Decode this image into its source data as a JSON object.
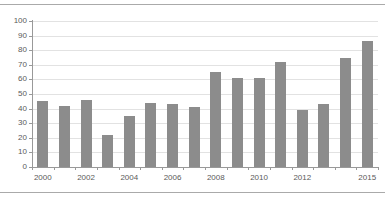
{
  "chart_data": {
    "type": "bar",
    "title": "",
    "subtitle": "",
    "xlabel": "",
    "ylabel": "",
    "categories": [
      "2000",
      "2001",
      "2002",
      "2003",
      "2004",
      "2005",
      "2006",
      "2007",
      "2008",
      "2009",
      "2010",
      "2011",
      "2012",
      "2013",
      "2014",
      "2015"
    ],
    "values": [
      45,
      42,
      46,
      22,
      35,
      44,
      43,
      41,
      65,
      61,
      61,
      72,
      39,
      43,
      75,
      86
    ],
    "series": [
      {
        "name": "",
        "values": [
          45,
          42,
          46,
          22,
          35,
          44,
          43,
          41,
          65,
          61,
          61,
          72,
          39,
          43,
          75,
          86
        ]
      }
    ],
    "ylim": [
      0,
      100
    ],
    "yticks": [
      0,
      10,
      20,
      30,
      40,
      50,
      60,
      70,
      80,
      90,
      100
    ],
    "ytick_labels": [
      "0",
      "10",
      "20",
      "30",
      "40",
      "50",
      "60",
      "70",
      "80",
      "90",
      "100"
    ],
    "xtick_labels": [
      "2000",
      "2002",
      "2004",
      "2006",
      "2008",
      "2010",
      "2012",
      "2015"
    ],
    "xtick_categories": [
      "2000",
      "2002",
      "2004",
      "2006",
      "2008",
      "2010",
      "2012",
      "2015"
    ],
    "grid": true,
    "grid_axis": "y",
    "legend": false,
    "legend_position": "none",
    "bar_color": "#8c8c8c",
    "grid_color": "#e2e2e2",
    "axis_color": "#999999",
    "tick_label_color": "#5a5a5a",
    "background_color": "#ffffff",
    "rules": [
      "top-rule",
      "bottom-rule"
    ]
  }
}
